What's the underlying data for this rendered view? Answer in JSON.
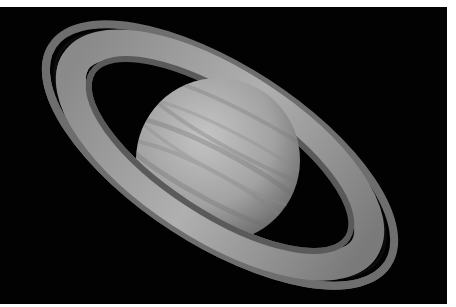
{
  "image": {
    "subject": "Saturn with rings and southern aurora",
    "background_color": "#020202",
    "border_color": "#ffffff",
    "planet_color": "#a8a8a8",
    "ring_color": "#9a9a9a",
    "aurora_color": "#f0f0f0"
  }
}
